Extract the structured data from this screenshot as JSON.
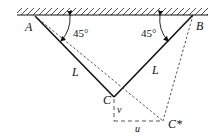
{
  "diagram": {
    "type": "two-bar truss displacement diagram",
    "points": {
      "A": {
        "label": "A",
        "x": 35,
        "y": 16
      },
      "B": {
        "label": "B",
        "x": 193,
        "y": 15
      },
      "C": {
        "label": "C",
        "x": 114,
        "y": 97
      },
      "C_star": {
        "label": "C*",
        "x": 163,
        "y": 121
      }
    },
    "bars": [
      {
        "from": "A",
        "to": "C",
        "label": "L",
        "angle_label": "45°"
      },
      {
        "from": "B",
        "to": "C",
        "label": "L",
        "angle_label": "45°"
      }
    ],
    "displacements": {
      "vertical": {
        "label": "v"
      },
      "horizontal": {
        "label": "u"
      }
    },
    "colors": {
      "line": "#111111",
      "dashed": "#444444",
      "background": "#ffffff"
    }
  }
}
